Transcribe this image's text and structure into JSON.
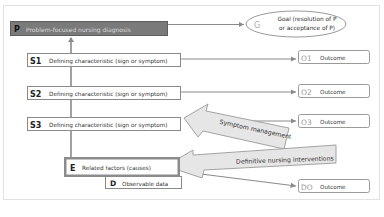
{
  "diagram": {
    "problem": {
      "code": "P",
      "label": "Problem-focused nursing diagnosis"
    },
    "goal": {
      "code": "G",
      "label_line1": "Goal (resolution of P",
      "label_line2": "or acceptance of P)"
    },
    "characteristics": [
      {
        "code": "S1",
        "label": "Defining characteristic (sign or symptom)"
      },
      {
        "code": "S2",
        "label": "Defining characteristic (sign or symptom)"
      },
      {
        "code": "S3",
        "label": "Defining characteristic (sign or symptom)"
      }
    ],
    "outcomes": [
      {
        "code": "O1",
        "label": "Outcome"
      },
      {
        "code": "O2",
        "label": "Outcome"
      },
      {
        "code": "O3",
        "label": "Outcome"
      },
      {
        "code": "DO",
        "label": "Outcome"
      }
    ],
    "etiology": {
      "code": "E",
      "label": "Related factors (causes)"
    },
    "data": {
      "code": "D",
      "label": "Observable data"
    },
    "interventions": [
      {
        "label": "Symptom management"
      },
      {
        "label": "Definitive nursing interventions"
      }
    ],
    "colors": {
      "problem_fill": "#7a7a7a",
      "problem_text": "#d8d8d8",
      "line": "#8a8a8a",
      "box_border": "#9a9a9a",
      "arrow_fill": "#e6e6e6",
      "arrow_stroke": "#9a9a9a",
      "etiology_border": "#8c8c8c",
      "panel_border": "#e0e0e0"
    }
  }
}
